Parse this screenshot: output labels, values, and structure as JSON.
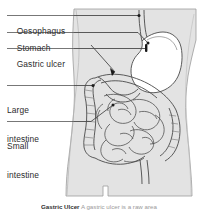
{
  "figure": {
    "colors": {
      "body_fill": "#e3e3e3",
      "body_outline": "#9c9c9c",
      "organ_fill": "#ffffff",
      "organ_outline": "#4a4a4a",
      "leader_line": "#4a4a4a",
      "marker": "#1a1a1a",
      "text": "#2c2c2c",
      "background": "#ffffff"
    },
    "labels": [
      {
        "id": "oesophagus",
        "text": "Oesophagus",
        "lines": [
          "Oesophagus"
        ]
      },
      {
        "id": "stomach",
        "text": "Stomach",
        "lines": [
          "Stomach"
        ]
      },
      {
        "id": "gastric_ulcer",
        "text": "Gastric ulcer",
        "lines": [
          "Gastric ulcer"
        ]
      },
      {
        "id": "large_intestine",
        "text": "Large intestine",
        "lines": [
          "Large",
          "intestine"
        ]
      },
      {
        "id": "small_intestine",
        "text": "Small intestine",
        "lines": [
          "Small",
          "intestine"
        ]
      }
    ]
  },
  "labels": {
    "oesophagus": "Oesophagus",
    "stomach": "Stomach",
    "gastric_ulcer": "Gastric ulcer",
    "large_line1": "Large",
    "large_line2": "intestine",
    "small_line1": "Small",
    "small_line2": "intestine"
  },
  "caption": {
    "title": "Gastric Ulcer",
    "body": "A gastric ulcer is a raw area"
  }
}
